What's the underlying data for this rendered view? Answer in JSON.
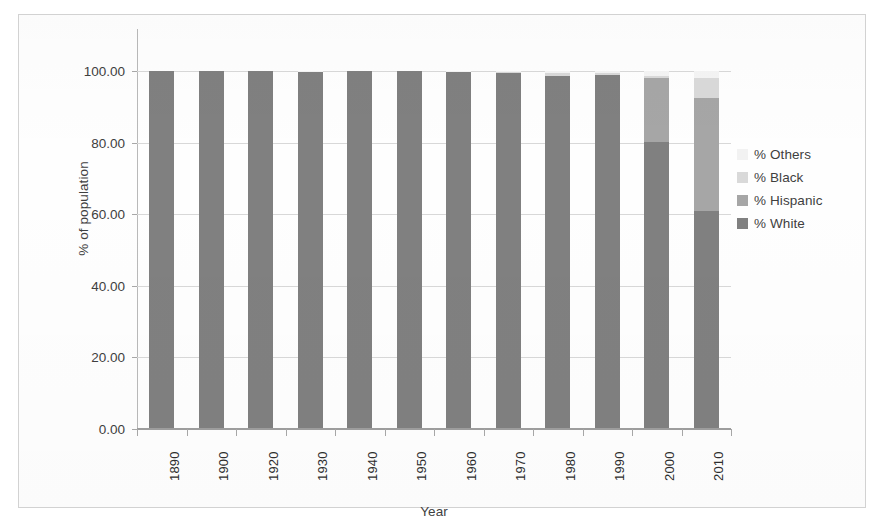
{
  "chart_data": {
    "type": "bar",
    "subtype": "stacked-bar",
    "title": "",
    "xlabel": "Year",
    "ylabel": "% of population",
    "ylim": [
      0,
      100
    ],
    "ytick_values": [
      0,
      20,
      40,
      60,
      80,
      100
    ],
    "ytick_labels": [
      "0.00",
      "20.00",
      "40.00",
      "60.00",
      "80.00",
      "100.00"
    ],
    "grid": true,
    "legend_position": "right",
    "categories": [
      "1890",
      "1900",
      "1920",
      "1930",
      "1940",
      "1950",
      "1960",
      "1970",
      "1980",
      "1990",
      "2000",
      "2010"
    ],
    "series": [
      {
        "name": "% White",
        "color": "#808080",
        "values": [
          100.0,
          100.0,
          100.0,
          99.6,
          100.0,
          100.0,
          99.7,
          99.5,
          98.6,
          98.8,
          80.1,
          61.0
        ]
      },
      {
        "name": "% Hispanic",
        "color": "#a6a6a6",
        "values": [
          0.0,
          0.0,
          0.0,
          0.0,
          0.0,
          0.0,
          0.0,
          0.0,
          0.0,
          0.0,
          18.0,
          31.5
        ]
      },
      {
        "name": "% Black",
        "color": "#d9d9d9",
        "values": [
          0.0,
          0.0,
          0.0,
          0.3,
          0.0,
          0.0,
          0.2,
          0.3,
          0.8,
          0.7,
          0.5,
          5.5
        ]
      },
      {
        "name": "% Others",
        "color": "#f2f2f2",
        "values": [
          0.0,
          0.0,
          0.0,
          0.1,
          0.0,
          0.0,
          0.1,
          0.2,
          0.6,
          0.5,
          1.4,
          2.0
        ]
      }
    ]
  },
  "legend": {
    "items": [
      {
        "label": "% Others",
        "color": "#f2f2f2"
      },
      {
        "label": "% Black",
        "color": "#d9d9d9"
      },
      {
        "label": "% Hispanic",
        "color": "#a6a6a6"
      },
      {
        "label": "% White",
        "color": "#808080"
      }
    ]
  },
  "axes": {
    "y_title": "% of population",
    "x_title": "Year"
  }
}
